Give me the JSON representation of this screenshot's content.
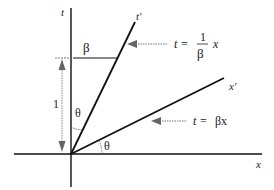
{
  "diagram": {
    "axes": {
      "t_label": "t",
      "x_label": "x",
      "t_prime_label": "t′",
      "x_prime_label": "x′"
    },
    "annotations": {
      "beta_segment": "β",
      "unit_length": "1",
      "angle_upper": "θ",
      "angle_lower": "θ"
    },
    "equations": {
      "t_prime_line": {
        "lhs": "t =",
        "numerator": "1",
        "denominator": "β",
        "rhs": "x"
      },
      "x_prime_line": {
        "lhs": "t =",
        "rhs": "βx"
      }
    },
    "colors": {
      "line": "#111111",
      "arrow": "#777777"
    }
  }
}
